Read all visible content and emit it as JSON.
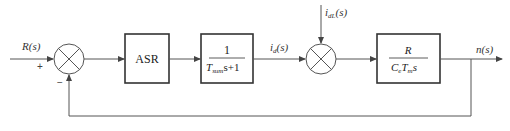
{
  "diagram": {
    "type": "block-diagram",
    "title": "",
    "input": {
      "label": "R(s)",
      "sign": "+"
    },
    "feedback_sign": "−",
    "blocks": [
      {
        "id": "asr",
        "label": "ASR"
      },
      {
        "id": "current-loop",
        "numerator": "1",
        "denominator_T": "T",
        "denominator_sub": "sum",
        "denominator_rest": "s+1"
      },
      {
        "id": "motor",
        "numerator": "R",
        "denominator_C": "C",
        "denominator_C_sub": "e",
        "denominator_T": "T",
        "denominator_T_sub": "m",
        "denominator_rest": "s"
      }
    ],
    "signals": {
      "current_main": "i",
      "current_main_sub": "d",
      "current_main_arg": "(s)",
      "disturbance": "i",
      "disturbance_sub": "dL",
      "disturbance_arg": "(s)",
      "output": "n(s)"
    },
    "colors": {
      "line": "#555555",
      "box": "#333333",
      "background": "#ffffff"
    }
  }
}
